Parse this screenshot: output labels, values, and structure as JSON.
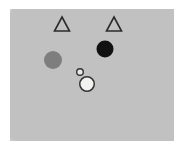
{
  "canvas": {
    "width": 184,
    "height": 154,
    "background_color": "#ffffff"
  },
  "panel": {
    "label": "scene-panel",
    "x": 10,
    "y": 9,
    "width": 164,
    "height": 132,
    "fill_color": "#c9c9c9",
    "texture": "uniform grainy light gray"
  },
  "shapes": [
    {
      "id": "triangle-left",
      "type": "triangle",
      "style": "outline",
      "cx": 62,
      "cy": 24,
      "width": 15,
      "height": 14,
      "fill_color": "none",
      "stroke_color": "#2b2b2b",
      "stroke_width": 1.6
    },
    {
      "id": "triangle-right",
      "type": "triangle",
      "style": "outline",
      "cx": 114,
      "cy": 24,
      "width": 15,
      "height": 14,
      "fill_color": "none",
      "stroke_color": "#2b2b2b",
      "stroke_width": 1.6
    },
    {
      "id": "circle-gray",
      "type": "circle",
      "style": "filled",
      "cx": 53,
      "cy": 60,
      "diameter": 18,
      "fill_color": "#7e7e7e",
      "stroke_color": "none",
      "stroke_width": 0
    },
    {
      "id": "circle-black",
      "type": "circle",
      "style": "filled",
      "cx": 105,
      "cy": 49,
      "diameter": 17,
      "fill_color": "#111111",
      "stroke_color": "none",
      "stroke_width": 0
    },
    {
      "id": "circle-white-small",
      "type": "circle",
      "style": "outlined-light",
      "cx": 80,
      "cy": 72,
      "diameter": 8,
      "fill_color": "#e8e8e4",
      "stroke_color": "#333333",
      "stroke_width": 1.4
    },
    {
      "id": "circle-white-large",
      "type": "circle",
      "style": "outlined-light",
      "cx": 87,
      "cy": 84,
      "diameter": 16,
      "fill_color": "#f2f2ee",
      "stroke_color": "#333333",
      "stroke_width": 1.5
    }
  ]
}
